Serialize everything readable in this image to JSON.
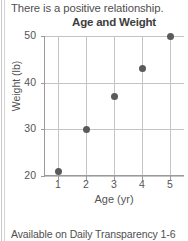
{
  "slide": {
    "intro_text": "There is a positive relationship.",
    "footer_note": "Available on Daily Transparency 1-6"
  },
  "chart_data": {
    "type": "scatter",
    "title": "Age and Weight",
    "xlabel": "Age (yr)",
    "ylabel": "Weight (lb)",
    "x": [
      1,
      2,
      3,
      4,
      5
    ],
    "y": [
      21,
      30,
      37,
      43,
      50
    ],
    "points": [
      {
        "x": 1,
        "y": 21
      },
      {
        "x": 2,
        "y": 30
      },
      {
        "x": 3,
        "y": 37
      },
      {
        "x": 4,
        "y": 43
      },
      {
        "x": 5,
        "y": 50
      }
    ],
    "xlim": [
      0.5,
      5.5
    ],
    "ylim": [
      20,
      50
    ],
    "xticks": [
      1,
      2,
      3,
      4,
      5
    ],
    "xtick_labels": [
      "1",
      "2",
      "3",
      "4",
      "5"
    ],
    "yticks": [
      20,
      30,
      40,
      50
    ],
    "ytick_labels": [
      "20",
      "30",
      "40",
      "50"
    ],
    "grid": true,
    "legend": null,
    "marker_color": "#5a5a5a",
    "grid_color": "#c4c4c4",
    "axis_color": "#9a9a9a"
  }
}
